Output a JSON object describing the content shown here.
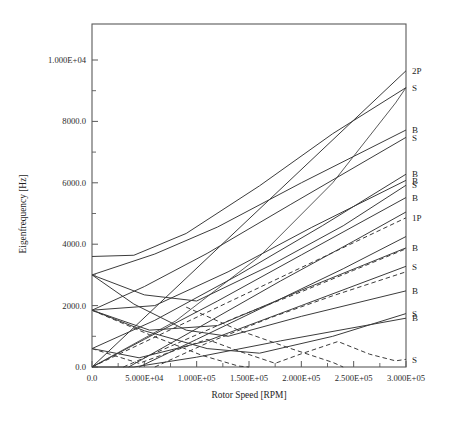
{
  "figure": {
    "title": "",
    "domain": "Chart"
  },
  "chart_data": {
    "type": "line",
    "title": "",
    "xlabel": "Rotor Speed [RPM]",
    "ylabel": "Eigenfrequency [Hz]",
    "xlim": [
      0,
      300000
    ],
    "ylim": [
      0,
      11000
    ],
    "grid": false,
    "legend": "right-edge-inline-labels",
    "xticks": [
      0,
      50000,
      100000,
      150000,
      200000,
      250000,
      300000
    ],
    "xticklabels": [
      "0.0",
      "5.000E+04",
      "1.000E+05",
      "1.500E+05",
      "2.000E+05",
      "2.500E+05",
      "3.000E+05"
    ],
    "yticks": [
      0,
      2000,
      4000,
      6000,
      8000,
      10000
    ],
    "yticklabels": [
      "0.0",
      "2000.0",
      "4000.0",
      "6000.0",
      "8000.0",
      "1.000E+04"
    ],
    "xminorticks": [
      25000,
      75000,
      125000,
      175000,
      225000,
      275000
    ],
    "yminorticks": [
      1000,
      3000,
      5000,
      7000,
      9000
    ],
    "series": [
      {
        "name": "2P",
        "label": "2P",
        "style": "solid",
        "points": [
          [
            0,
            0
          ],
          [
            300000,
            9650
          ]
        ]
      },
      {
        "name": "S-9650-top",
        "label": "S",
        "style": "solid",
        "points": [
          [
            0,
            3600
          ],
          [
            40000,
            3640
          ],
          [
            90000,
            4350
          ],
          [
            160000,
            5900
          ],
          [
            230000,
            7600
          ],
          [
            300000,
            9100
          ]
        ]
      },
      {
        "name": "B-7700",
        "label": "B",
        "style": "solid",
        "points": [
          [
            0,
            3000
          ],
          [
            60000,
            3680
          ],
          [
            120000,
            4560
          ],
          [
            200000,
            6000
          ],
          [
            300000,
            7720
          ]
        ]
      },
      {
        "name": "S-7550",
        "label": "S",
        "style": "solid",
        "points": [
          [
            0,
            1850
          ],
          [
            50000,
            2620
          ],
          [
            110000,
            3700
          ],
          [
            190000,
            5300
          ],
          [
            300000,
            7480
          ]
        ]
      },
      {
        "name": "B-6300",
        "label": "B",
        "style": "solid",
        "points": [
          [
            0,
            600
          ],
          [
            60000,
            1520
          ],
          [
            140000,
            3000
          ],
          [
            220000,
            4600
          ],
          [
            300000,
            6280
          ]
        ]
      },
      {
        "name": "B-6100",
        "label": "B",
        "style": "solid",
        "points": [
          [
            0,
            1850
          ],
          [
            60000,
            2000
          ],
          [
            130000,
            3100
          ],
          [
            210000,
            4550
          ],
          [
            300000,
            6080
          ]
        ]
      },
      {
        "name": "S-5950",
        "label": "S",
        "style": "solid",
        "points": [
          [
            0,
            3000
          ],
          [
            50000,
            2350
          ],
          [
            100000,
            2150
          ],
          [
            170000,
            3300
          ],
          [
            240000,
            4600
          ],
          [
            300000,
            5920
          ]
        ]
      },
      {
        "name": "B-5550",
        "label": "B",
        "style": "solid",
        "points": [
          [
            0,
            0
          ],
          [
            50000,
            900
          ],
          [
            120000,
            2150
          ],
          [
            200000,
            3650
          ],
          [
            300000,
            5520
          ]
        ]
      },
      {
        "name": "1P",
        "label": "1P",
        "style": "dashed",
        "points": [
          [
            0,
            0
          ],
          [
            300000,
            4860
          ]
        ]
      },
      {
        "name": "B-3900",
        "label": "B",
        "style": "solid",
        "points": [
          [
            0,
            1850
          ],
          [
            55000,
            1200
          ],
          [
            120000,
            1350
          ],
          [
            200000,
            2500
          ],
          [
            300000,
            3880
          ]
        ]
      },
      {
        "name": "S-3300",
        "label": "S",
        "style": "solid",
        "points": [
          [
            0,
            600
          ],
          [
            45000,
            300
          ],
          [
            110000,
            850
          ],
          [
            200000,
            2000
          ],
          [
            300000,
            3280
          ]
        ]
      },
      {
        "name": "B-2500",
        "label": "B",
        "style": "solid",
        "points": [
          [
            0,
            3000
          ],
          [
            40000,
            2050
          ],
          [
            90000,
            1200
          ],
          [
            130000,
            1000
          ],
          [
            200000,
            1650
          ],
          [
            300000,
            2480
          ]
        ]
      },
      {
        "name": "S-1750",
        "label": "S",
        "style": "solid",
        "points": [
          [
            0,
            1850
          ],
          [
            50000,
            1180
          ],
          [
            110000,
            600
          ],
          [
            160000,
            450
          ],
          [
            230000,
            1000
          ],
          [
            300000,
            1740
          ]
        ]
      },
      {
        "name": "B-1600",
        "label": "B",
        "style": "solid",
        "points": [
          [
            0,
            0
          ],
          [
            40000,
            0
          ],
          [
            100000,
            320
          ],
          [
            180000,
            850
          ],
          [
            300000,
            1590
          ]
        ]
      },
      {
        "name": "S-250-dashed",
        "label": "S",
        "style": "dashed",
        "points": [
          [
            0,
            600
          ],
          [
            45000,
            120
          ],
          [
            70000,
            430
          ],
          [
            110000,
            900
          ],
          [
            140000,
            520
          ],
          [
            175000,
            120
          ],
          [
            200000,
            430
          ],
          [
            235000,
            830
          ],
          [
            265000,
            420
          ],
          [
            290000,
            200
          ],
          [
            300000,
            250
          ]
        ]
      },
      {
        "name": "dashed-descend-a",
        "label": "",
        "style": "dashed",
        "points": [
          [
            0,
            1850
          ],
          [
            55000,
            1050
          ],
          [
            105000,
            380
          ],
          [
            140000,
            30
          ],
          [
            150000,
            0
          ]
        ]
      },
      {
        "name": "dashed-ascend-a",
        "label": "",
        "style": "dashed",
        "points": [
          [
            30000,
            0
          ],
          [
            80000,
            750
          ],
          [
            140000,
            1650
          ],
          [
            200000,
            2450
          ],
          [
            250000,
            3150
          ],
          [
            300000,
            3850
          ]
        ]
      },
      {
        "name": "dashed-cross-b",
        "label": "",
        "style": "dashed",
        "points": [
          [
            60000,
            0
          ],
          [
            110000,
            780
          ],
          [
            170000,
            1600
          ],
          [
            230000,
            2320
          ],
          [
            300000,
            3100
          ]
        ]
      },
      {
        "name": "dashed-descend-b",
        "label": "",
        "style": "dashed",
        "points": [
          [
            90000,
            1950
          ],
          [
            140000,
            1200
          ],
          [
            190000,
            600
          ],
          [
            230000,
            150
          ],
          [
            240000,
            0
          ]
        ]
      },
      {
        "name": "solid-rise-low-a",
        "label": "",
        "style": "solid",
        "points": [
          [
            45000,
            0
          ],
          [
            100000,
            900
          ],
          [
            170000,
            2050
          ],
          [
            240000,
            3200
          ],
          [
            300000,
            4250
          ]
        ]
      },
      {
        "name": "solid-rise-low-b",
        "label": "",
        "style": "solid",
        "points": [
          [
            35000,
            0
          ],
          [
            100000,
            1250
          ],
          [
            180000,
            2800
          ],
          [
            250000,
            4100
          ],
          [
            300000,
            5050
          ]
        ]
      },
      {
        "name": "solid-steep-a",
        "label": "",
        "style": "thin",
        "points": [
          [
            0,
            0
          ],
          [
            80000,
            1500
          ],
          [
            160000,
            3600
          ],
          [
            230000,
            6000
          ],
          [
            290000,
            8600
          ],
          [
            300000,
            9100
          ]
        ]
      }
    ]
  },
  "curve_labels": [
    {
      "text": "2P",
      "x": 300000,
      "y": 9650
    },
    {
      "text": "S",
      "x": 300000,
      "y": 9100
    },
    {
      "text": "B",
      "x": 300000,
      "y": 7720
    },
    {
      "text": "S",
      "x": 300000,
      "y": 7480
    },
    {
      "text": "B",
      "x": 300000,
      "y": 6280
    },
    {
      "text": "B",
      "x": 300000,
      "y": 6080
    },
    {
      "text": "S",
      "x": 300000,
      "y": 5920
    },
    {
      "text": "B",
      "x": 300000,
      "y": 5520
    },
    {
      "text": "1P",
      "x": 300000,
      "y": 4860
    },
    {
      "text": "B",
      "x": 300000,
      "y": 3880
    },
    {
      "text": "S",
      "x": 300000,
      "y": 3280
    },
    {
      "text": "B",
      "x": 300000,
      "y": 2480
    },
    {
      "text": "S",
      "x": 300000,
      "y": 1740
    },
    {
      "text": "B",
      "x": 300000,
      "y": 1590
    },
    {
      "text": "S",
      "x": 300000,
      "y": 250
    }
  ]
}
